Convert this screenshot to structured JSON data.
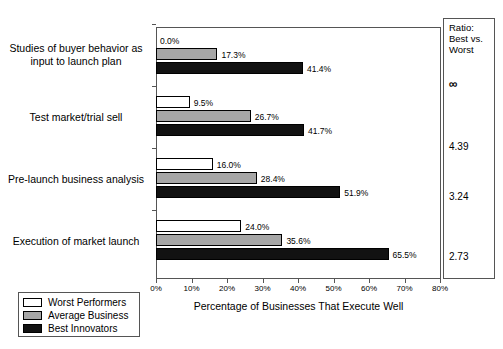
{
  "chart_data": {
    "type": "bar",
    "orientation": "horizontal",
    "title": "",
    "xlabel": "Percentage of Businesses That Execute Well",
    "ylabel": "",
    "xlim": [
      0,
      80
    ],
    "xticks": [
      0,
      10,
      20,
      30,
      40,
      50,
      60,
      70,
      80
    ],
    "xticklabels": [
      "0%",
      "10%",
      "20%",
      "30%",
      "40%",
      "50%",
      "60%",
      "70%",
      "80%"
    ],
    "grid": false,
    "legend_position": "bottom-left",
    "categories": [
      "Studies of buyer behavior as input to launch plan",
      "Test market/trial sell",
      "Pre-launch business analysis",
      "Execution of market launch"
    ],
    "series": [
      {
        "name": "Worst Performers",
        "color": "#ffffff",
        "values": [
          0.0,
          9.5,
          16.0,
          24.0
        ],
        "labels": [
          "0.0%",
          "9.5%",
          "16.0%",
          "24.0%"
        ]
      },
      {
        "name": "Average Business",
        "color": "#a6a6a6",
        "values": [
          17.3,
          26.7,
          28.4,
          35.6
        ],
        "labels": [
          "17.3%",
          "26.7%",
          "28.4%",
          "35.6%"
        ]
      },
      {
        "name": "Best Innovators",
        "color": "#121212",
        "values": [
          41.4,
          41.7,
          51.9,
          65.5
        ],
        "labels": [
          "41.4%",
          "41.7%",
          "51.9%",
          "65.5%"
        ]
      }
    ],
    "annotation_column": {
      "header": "Ratio: Best vs. Worst",
      "header_lines": [
        "Ratio:",
        "Best vs.",
        "Worst"
      ],
      "values": [
        "∞",
        "4.39",
        "3.24",
        "2.73"
      ]
    }
  },
  "legend": {
    "items": [
      {
        "label": "Worst Performers",
        "swatch": "worst"
      },
      {
        "label": "Average Business",
        "swatch": "average"
      },
      {
        "label": "Best Innovators",
        "swatch": "best"
      }
    ]
  },
  "category_labels": [
    {
      "line1": "Studies of buyer behavior as",
      "line2": "input to launch plan"
    },
    {
      "line1": "Test market/trial sell",
      "line2": ""
    },
    {
      "line1": "Pre-launch business analysis",
      "line2": ""
    },
    {
      "line1": "Execution of market launch",
      "line2": ""
    }
  ]
}
